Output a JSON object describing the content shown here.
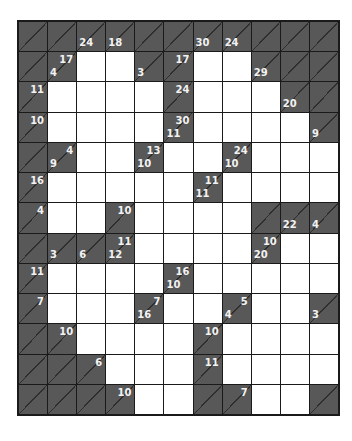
{
  "puzzle": {
    "type": "kakuro",
    "cols": 11,
    "rows": 13,
    "colors": {
      "dark_cell": "#585858",
      "white_cell": "#ffffff",
      "grid_line": "#1a1a1a",
      "clue_text": "#f2f2f2"
    },
    "grid": [
      [
        {
          "t": "d"
        },
        {
          "t": "d"
        },
        {
          "t": "d",
          "down": "24"
        },
        {
          "t": "d",
          "down": "18"
        },
        {
          "t": "d"
        },
        {
          "t": "d"
        },
        {
          "t": "d",
          "down": "30"
        },
        {
          "t": "d",
          "down": "24"
        },
        {
          "t": "d"
        },
        {
          "t": "d"
        },
        {
          "t": "d"
        }
      ],
      [
        {
          "t": "d"
        },
        {
          "t": "d",
          "across": "17",
          "down": "4"
        },
        {
          "t": "w"
        },
        {
          "t": "w"
        },
        {
          "t": "d",
          "down": "3"
        },
        {
          "t": "d",
          "across": "17"
        },
        {
          "t": "w"
        },
        {
          "t": "w"
        },
        {
          "t": "d",
          "down": "29"
        },
        {
          "t": "d"
        },
        {
          "t": "d"
        }
      ],
      [
        {
          "t": "d",
          "across": "11"
        },
        {
          "t": "w"
        },
        {
          "t": "w"
        },
        {
          "t": "w"
        },
        {
          "t": "w"
        },
        {
          "t": "d",
          "across": "24"
        },
        {
          "t": "w"
        },
        {
          "t": "w"
        },
        {
          "t": "w"
        },
        {
          "t": "d",
          "down": "20"
        },
        {
          "t": "d"
        }
      ],
      [
        {
          "t": "d",
          "across": "10"
        },
        {
          "t": "w"
        },
        {
          "t": "w"
        },
        {
          "t": "w"
        },
        {
          "t": "w"
        },
        {
          "t": "d",
          "across": "30",
          "down": "11"
        },
        {
          "t": "w"
        },
        {
          "t": "w"
        },
        {
          "t": "w"
        },
        {
          "t": "w"
        },
        {
          "t": "d",
          "down": "9"
        }
      ],
      [
        {
          "t": "d"
        },
        {
          "t": "d",
          "across": "4",
          "down": "9"
        },
        {
          "t": "w"
        },
        {
          "t": "w"
        },
        {
          "t": "d",
          "across": "13",
          "down": "10"
        },
        {
          "t": "w"
        },
        {
          "t": "w"
        },
        {
          "t": "d",
          "across": "24",
          "down": "10"
        },
        {
          "t": "w"
        },
        {
          "t": "w"
        },
        {
          "t": "w"
        }
      ],
      [
        {
          "t": "d",
          "across": "16"
        },
        {
          "t": "w"
        },
        {
          "t": "w"
        },
        {
          "t": "w"
        },
        {
          "t": "w"
        },
        {
          "t": "w"
        },
        {
          "t": "d",
          "across": "11",
          "down": "11"
        },
        {
          "t": "w"
        },
        {
          "t": "w"
        },
        {
          "t": "w"
        },
        {
          "t": "w"
        }
      ],
      [
        {
          "t": "d",
          "across": "4"
        },
        {
          "t": "w"
        },
        {
          "t": "w"
        },
        {
          "t": "d",
          "across": "10"
        },
        {
          "t": "w"
        },
        {
          "t": "w"
        },
        {
          "t": "w"
        },
        {
          "t": "w"
        },
        {
          "t": "d"
        },
        {
          "t": "d",
          "down": "22"
        },
        {
          "t": "d",
          "down": "4"
        }
      ],
      [
        {
          "t": "d"
        },
        {
          "t": "d",
          "down": "3"
        },
        {
          "t": "d",
          "down": "6"
        },
        {
          "t": "d",
          "across": "11",
          "down": "12"
        },
        {
          "t": "w"
        },
        {
          "t": "w"
        },
        {
          "t": "w"
        },
        {
          "t": "w"
        },
        {
          "t": "d",
          "across": "10",
          "down": "20"
        },
        {
          "t": "w"
        },
        {
          "t": "w"
        }
      ],
      [
        {
          "t": "d",
          "across": "11"
        },
        {
          "t": "w"
        },
        {
          "t": "w"
        },
        {
          "t": "w"
        },
        {
          "t": "w"
        },
        {
          "t": "d",
          "across": "16",
          "down": "10"
        },
        {
          "t": "w"
        },
        {
          "t": "w"
        },
        {
          "t": "w"
        },
        {
          "t": "w"
        },
        {
          "t": "w"
        }
      ],
      [
        {
          "t": "d",
          "across": "7"
        },
        {
          "t": "w"
        },
        {
          "t": "w"
        },
        {
          "t": "w"
        },
        {
          "t": "d",
          "across": "7",
          "down": "16"
        },
        {
          "t": "w"
        },
        {
          "t": "w"
        },
        {
          "t": "d",
          "across": "5",
          "down": "4"
        },
        {
          "t": "w"
        },
        {
          "t": "w"
        },
        {
          "t": "d",
          "down": "3"
        }
      ],
      [
        {
          "t": "d"
        },
        {
          "t": "d",
          "across": "10"
        },
        {
          "t": "w"
        },
        {
          "t": "w"
        },
        {
          "t": "w"
        },
        {
          "t": "w"
        },
        {
          "t": "d",
          "across": "10"
        },
        {
          "t": "w"
        },
        {
          "t": "w"
        },
        {
          "t": "w"
        },
        {
          "t": "w"
        }
      ],
      [
        {
          "t": "d"
        },
        {
          "t": "d"
        },
        {
          "t": "d",
          "across": "6"
        },
        {
          "t": "w"
        },
        {
          "t": "w"
        },
        {
          "t": "w"
        },
        {
          "t": "d",
          "across": "11"
        },
        {
          "t": "w"
        },
        {
          "t": "w"
        },
        {
          "t": "w"
        },
        {
          "t": "w"
        }
      ],
      [
        {
          "t": "d"
        },
        {
          "t": "d"
        },
        {
          "t": "d"
        },
        {
          "t": "d",
          "across": "10"
        },
        {
          "t": "w"
        },
        {
          "t": "w"
        },
        {
          "t": "d"
        },
        {
          "t": "d",
          "across": "7"
        },
        {
          "t": "w"
        },
        {
          "t": "w"
        },
        {
          "t": "d"
        }
      ]
    ]
  }
}
